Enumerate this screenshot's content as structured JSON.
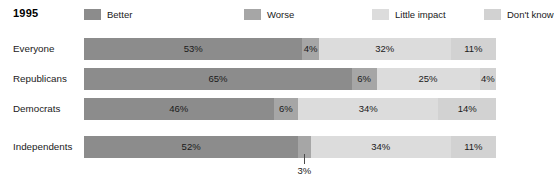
{
  "chart_data": {
    "type": "bar",
    "subtype": "100% stacked horizontal bar",
    "title": "1995",
    "xlabel": "",
    "ylabel": "",
    "xlim": [
      0,
      100
    ],
    "grid": false,
    "legend_position": "top",
    "categories": [
      "Everyone",
      "Republicans",
      "Democrats",
      "Independents"
    ],
    "series": [
      {
        "name": "Better",
        "color": "#8c8c8c",
        "values": [
          53,
          65,
          46,
          52
        ]
      },
      {
        "name": "Worse",
        "color": "#a6a6a6",
        "values": [
          4,
          6,
          6,
          3
        ]
      },
      {
        "name": "Little impact",
        "color": "#dcdcdc",
        "values": [
          32,
          25,
          34,
          34
        ]
      },
      {
        "name": "Don't know",
        "color": "#d2d2d2",
        "values": [
          11,
          4,
          14,
          11
        ]
      }
    ],
    "value_labels": [
      [
        "53%",
        "4%",
        "32%",
        "11%"
      ],
      [
        "65%",
        "6%",
        "25%",
        "4%"
      ],
      [
        "46%",
        "6%",
        "34%",
        "14%"
      ],
      [
        "52%",
        "3%",
        "34%",
        "11%"
      ]
    ],
    "annotations": [
      {
        "text": "3%",
        "series": "Worse",
        "category": "Independents",
        "value": 3,
        "style": "leader-line-below"
      }
    ]
  },
  "header": {
    "year": "1995"
  },
  "legend": {
    "items": [
      {
        "label": "Better",
        "color": "#8c8c8c"
      },
      {
        "label": "Worse",
        "color": "#a6a6a6"
      },
      {
        "label": "Little impact",
        "color": "#dcdcdc"
      },
      {
        "label": "Don't know",
        "color": "#d2d2d2"
      }
    ]
  },
  "rows": [
    {
      "label": "Everyone",
      "segments": [
        {
          "name": "Better",
          "value": 53,
          "text": "53%",
          "color": "#8c8c8c"
        },
        {
          "name": "Worse",
          "value": 4,
          "text": "4%",
          "color": "#a6a6a6"
        },
        {
          "name": "Little impact",
          "value": 32,
          "text": "32%",
          "color": "#dcdcdc"
        },
        {
          "name": "Don't know",
          "value": 11,
          "text": "11%",
          "color": "#d2d2d2"
        }
      ]
    },
    {
      "label": "Republicans",
      "segments": [
        {
          "name": "Better",
          "value": 65,
          "text": "65%",
          "color": "#8c8c8c"
        },
        {
          "name": "Worse",
          "value": 6,
          "text": "6%",
          "color": "#a6a6a6"
        },
        {
          "name": "Little impact",
          "value": 25,
          "text": "25%",
          "color": "#dcdcdc"
        },
        {
          "name": "Don't know",
          "value": 4,
          "text": "4%",
          "color": "#d2d2d2"
        }
      ]
    },
    {
      "label": "Democrats",
      "segments": [
        {
          "name": "Better",
          "value": 46,
          "text": "46%",
          "color": "#8c8c8c"
        },
        {
          "name": "Worse",
          "value": 6,
          "text": "6%",
          "color": "#a6a6a6"
        },
        {
          "name": "Little impact",
          "value": 34,
          "text": "34%",
          "color": "#dcdcdc"
        },
        {
          "name": "Don't know",
          "value": 14,
          "text": "14%",
          "color": "#d2d2d2"
        }
      ]
    },
    {
      "label": "Independents",
      "segments": [
        {
          "name": "Better",
          "value": 52,
          "text": "52%",
          "color": "#8c8c8c"
        },
        {
          "name": "Worse",
          "value": 3,
          "text": "3%",
          "color": "#a6a6a6",
          "label_outside": true
        },
        {
          "name": "Little impact",
          "value": 34,
          "text": "34%",
          "color": "#dcdcdc"
        },
        {
          "name": "Don't know",
          "value": 11,
          "text": "11%",
          "color": "#d2d2d2"
        }
      ]
    }
  ],
  "callout": {
    "text": "3%"
  },
  "layout": {
    "bar_left": 84,
    "bar_width": 412,
    "row_tops": [
      38,
      68,
      98,
      136
    ],
    "row_height": 22,
    "legend_item_lefts": [
      0,
      160,
      288,
      400
    ]
  }
}
